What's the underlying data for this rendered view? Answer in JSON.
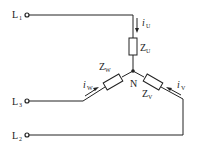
{
  "diagram": {
    "type": "three-phase star (wye) connected load",
    "lines": [
      {
        "id": "L1",
        "label": "L",
        "sub": "1"
      },
      {
        "id": "L3",
        "label": "L",
        "sub": "3"
      },
      {
        "id": "L2",
        "label": "L",
        "sub": "2"
      }
    ],
    "impedances": [
      {
        "id": "ZU",
        "label": "Z",
        "sub": "U"
      },
      {
        "id": "ZW",
        "label": "Z",
        "sub": "W"
      },
      {
        "id": "ZV",
        "label": "Z",
        "sub": "V"
      }
    ],
    "currents": [
      {
        "id": "iU",
        "label": "i",
        "sub": "U"
      },
      {
        "id": "iW",
        "label": "i",
        "sub": "W"
      },
      {
        "id": "iV",
        "label": "i",
        "sub": "V"
      }
    ],
    "neutral": {
      "label": "N"
    },
    "colors": {
      "stroke": "#222222",
      "background": "#ffffff"
    }
  }
}
